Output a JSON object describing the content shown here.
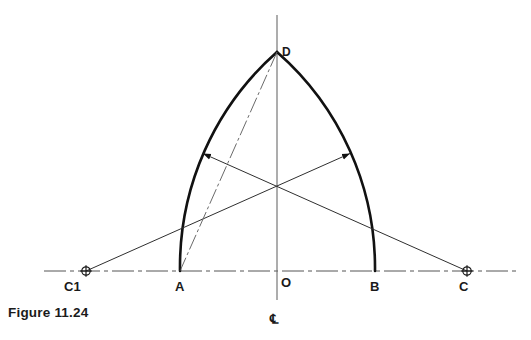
{
  "figure": {
    "caption": "Figure 11.24",
    "centerline_symbol": "℄"
  },
  "labels": {
    "c1": "C1",
    "a": "A",
    "o": "O",
    "b": "B",
    "c": "C",
    "d": "D"
  },
  "colors": {
    "arc": "#111111",
    "construction": "#3a3a3a",
    "centerline": "#555555",
    "text": "#1a1a1a",
    "background": "#ffffff"
  },
  "geometry": {
    "baseline_y": 271,
    "vertical_centerline_x": 277,
    "points": {
      "C1": {
        "x": 86,
        "y": 271
      },
      "A": {
        "x": 180,
        "y": 271
      },
      "O": {
        "x": 277,
        "y": 271
      },
      "B": {
        "x": 375,
        "y": 271
      },
      "C": {
        "x": 467,
        "y": 271
      },
      "D": {
        "x": 277,
        "y": 52
      }
    },
    "arrow_left_tip": {
      "x": 201,
      "y": 152
    },
    "arrow_right_tip": {
      "x": 352,
      "y": 152
    }
  }
}
